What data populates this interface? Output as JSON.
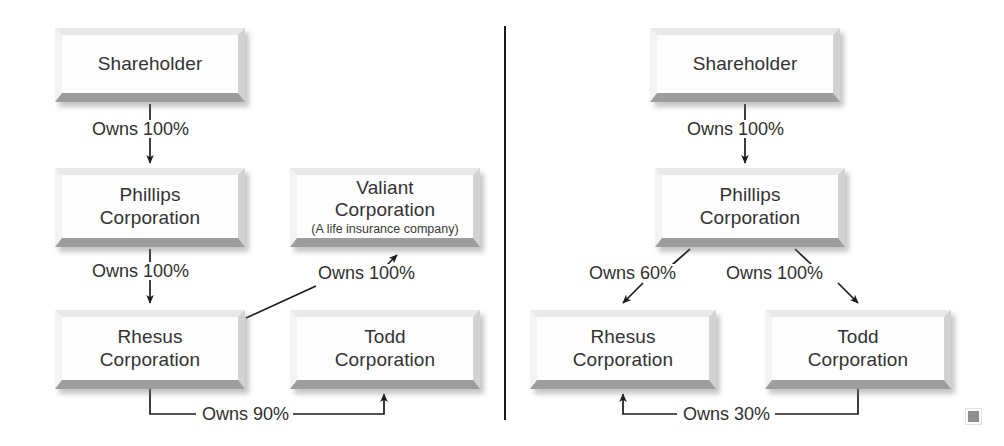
{
  "figure": {
    "type": "diagram",
    "subtype": "corporate-ownership-structure",
    "panel_count": 2,
    "background_color": "#ffffff",
    "box_fill_color": "#fdfdfd",
    "box_shadow_color": "#9d9d9d",
    "text_color": "#333333",
    "divider_color": "#1a1a1a"
  },
  "left_panel": {
    "nodes": [
      {
        "id": "l-shareholder",
        "title": "Shareholder",
        "subtitle": ""
      },
      {
        "id": "l-phillips",
        "title_line1": "Phillips",
        "title_line2": "Corporation",
        "subtitle": ""
      },
      {
        "id": "l-valiant",
        "title_line1": "Valiant",
        "title_line2": "Corporation",
        "subtitle": "(A life insurance company)"
      },
      {
        "id": "l-rhesus",
        "title_line1": "Rhesus",
        "title_line2": "Corporation",
        "subtitle": ""
      },
      {
        "id": "l-todd",
        "title_line1": "Todd",
        "title_line2": "Corporation",
        "subtitle": ""
      }
    ],
    "edges": [
      {
        "id": "l-e1",
        "from": "l-shareholder",
        "to": "l-phillips",
        "label": "Owns 100%",
        "style": "straight-down"
      },
      {
        "id": "l-e2",
        "from": "l-phillips",
        "to": "l-rhesus",
        "label": "Owns 100%",
        "style": "straight-down"
      },
      {
        "id": "l-e3",
        "from": "l-rhesus",
        "to": "l-valiant",
        "label": "Owns 100%",
        "style": "diagonal-up-right"
      },
      {
        "id": "l-e4",
        "from": "l-rhesus",
        "to": "l-todd",
        "label": "Owns 90%",
        "style": "bottom-elbow"
      }
    ]
  },
  "right_panel": {
    "nodes": [
      {
        "id": "r-shareholder",
        "title": "Shareholder",
        "subtitle": ""
      },
      {
        "id": "r-phillips",
        "title_line1": "Phillips",
        "title_line2": "Corporation",
        "subtitle": ""
      },
      {
        "id": "r-rhesus",
        "title_line1": "Rhesus",
        "title_line2": "Corporation",
        "subtitle": ""
      },
      {
        "id": "r-todd",
        "title_line1": "Todd",
        "title_line2": "Corporation",
        "subtitle": ""
      }
    ],
    "edges": [
      {
        "id": "r-e1",
        "from": "r-shareholder",
        "to": "r-phillips",
        "label": "Owns 100%",
        "style": "straight-down"
      },
      {
        "id": "r-e2",
        "from": "r-phillips",
        "to": "r-rhesus",
        "label": "Owns 60%",
        "style": "diagonal-down-left"
      },
      {
        "id": "r-e3",
        "from": "r-phillips",
        "to": "r-todd",
        "label": "Owns 100%",
        "style": "diagonal-down-right"
      },
      {
        "id": "r-e4",
        "from": "r-todd",
        "to": "r-rhesus",
        "label": "Owns 30%",
        "style": "bottom-elbow"
      }
    ]
  },
  "end_marker": {
    "name": "end-of-article-square",
    "color": "#8e8e8e"
  }
}
